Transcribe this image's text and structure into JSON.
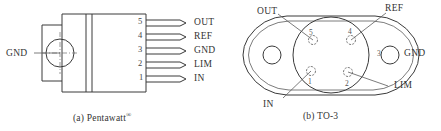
{
  "figure": {
    "panels": [
      {
        "id": "pentawatt",
        "caption_prefix": "(a)",
        "caption_label": "Pentawatt",
        "caption_mark": "®",
        "tab_label": "GND",
        "pins": [
          {
            "number": "5",
            "label": "OUT"
          },
          {
            "number": "4",
            "label": "REF"
          },
          {
            "number": "3",
            "label": "GND"
          },
          {
            "number": "2",
            "label": "LIM"
          },
          {
            "number": "1",
            "label": "IN"
          }
        ]
      },
      {
        "id": "to3",
        "caption_prefix": "(b)",
        "caption_label": "TO-3",
        "caption_mark": "",
        "pins": [
          {
            "number": "5",
            "label": "OUT"
          },
          {
            "number": "4",
            "label": "REF"
          },
          {
            "number": "3",
            "label": "GND"
          },
          {
            "number": "2",
            "label": "LIM"
          },
          {
            "number": "1",
            "label": "IN"
          }
        ]
      }
    ]
  },
  "colors": {
    "line": "#3a3a3a",
    "thin_line": "#5a5a5a",
    "text": "#333333",
    "background": "#ffffff"
  }
}
